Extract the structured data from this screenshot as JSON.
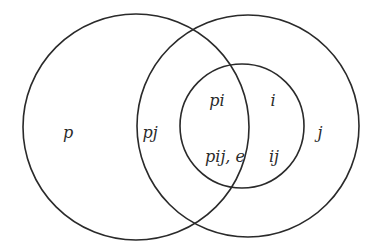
{
  "diagram": {
    "type": "venn",
    "colors": {
      "stroke": "#2a2a2a",
      "text": "#2a2a2a",
      "background": "#ffffff"
    },
    "circles": [
      {
        "id": "left",
        "cx": 136,
        "cy": 127,
        "r": 113
      },
      {
        "id": "right",
        "cx": 248,
        "cy": 126,
        "r": 111
      },
      {
        "id": "inner",
        "cx": 242,
        "cy": 126,
        "r": 62
      }
    ],
    "labels": [
      {
        "id": "p",
        "text": "p",
        "x": 68,
        "y": 138
      },
      {
        "id": "pj",
        "text": "pj",
        "x": 150,
        "y": 138
      },
      {
        "id": "pi",
        "text": "pi",
        "x": 217,
        "y": 106
      },
      {
        "id": "i",
        "text": "i",
        "x": 273,
        "y": 106
      },
      {
        "id": "j",
        "text": "j",
        "x": 320,
        "y": 138
      },
      {
        "id": "pij_e",
        "text": "pij, e",
        "x": 225,
        "y": 162
      },
      {
        "id": "ij",
        "text": "ij",
        "x": 274,
        "y": 162
      }
    ]
  }
}
